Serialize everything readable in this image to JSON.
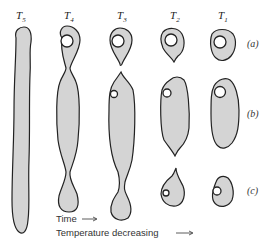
{
  "columns": [
    {
      "label": "T",
      "sub": "5"
    },
    {
      "label": "T",
      "sub": "4"
    },
    {
      "label": "T",
      "sub": "3"
    },
    {
      "label": "T",
      "sub": "2"
    },
    {
      "label": "T",
      "sub": "1"
    }
  ],
  "rows": [
    "(a)",
    "(b)",
    "(c)"
  ],
  "captions": {
    "time": "Time",
    "temperature": "Temperature decreasing"
  },
  "colors": {
    "fill": "#d4d4d4",
    "outline": "#222222"
  }
}
